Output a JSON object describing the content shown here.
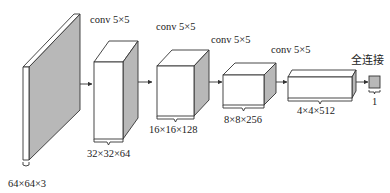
{
  "diagram": {
    "type": "cnn-architecture",
    "layers": [
      {
        "id": "input",
        "dims": "64×64×3",
        "op_label": ""
      },
      {
        "id": "conv1",
        "dims": "32×32×64",
        "op_label": "conv 5×5"
      },
      {
        "id": "conv2",
        "dims": "16×16×128",
        "op_label": "conv 5×5"
      },
      {
        "id": "conv3",
        "dims": "8×8×256",
        "op_label": "conv 5×5"
      },
      {
        "id": "conv4",
        "dims": "4×4×512",
        "op_label": "conv 5×5"
      },
      {
        "id": "fc",
        "dims": "1",
        "op_label": "全连接"
      }
    ],
    "colors": {
      "shade": "#b8b8b8",
      "stroke": "#333333",
      "background": "#ffffff"
    }
  }
}
